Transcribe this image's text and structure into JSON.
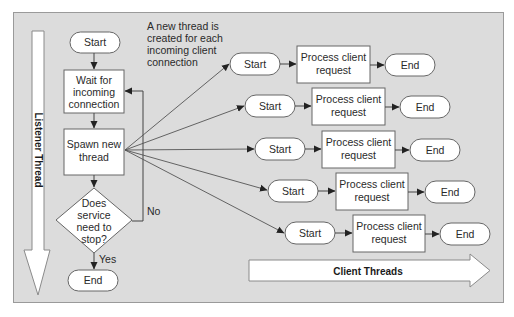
{
  "annotation": {
    "lines": [
      "A new thread is",
      "created for each",
      "incoming client",
      "connection"
    ]
  },
  "listener": {
    "arrow_label": "Listener Thread",
    "start": "Start",
    "wait": [
      "Wait for",
      "incoming",
      "connection"
    ],
    "spawn": [
      "Spawn new",
      "thread"
    ],
    "decision": [
      "Does",
      "service",
      "need to",
      "stop?"
    ],
    "no_label": "No",
    "yes_label": "Yes",
    "end": "End"
  },
  "client_threads": {
    "arrow_label": "Client Threads",
    "rows": [
      {
        "start": "Start",
        "process": [
          "Process client",
          "request"
        ],
        "end": "End"
      },
      {
        "start": "Start",
        "process": [
          "Process client",
          "request"
        ],
        "end": "End"
      },
      {
        "start": "Start",
        "process": [
          "Process client",
          "request"
        ],
        "end": "End"
      },
      {
        "start": "Start",
        "process": [
          "Process client",
          "request"
        ],
        "end": "End"
      },
      {
        "start": "Start",
        "process": [
          "Process client",
          "request"
        ],
        "end": "End"
      }
    ]
  },
  "colors": {
    "panel": "#dcdcdc",
    "panel_border": "#9a9a9a",
    "node_fill": "#ffffff",
    "stroke": "#555555"
  }
}
